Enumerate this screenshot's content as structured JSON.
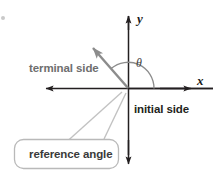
{
  "figure": {
    "width": 219,
    "height": 180,
    "background_color": "#ffffff"
  },
  "axes": {
    "x_label": "x",
    "y_label": "y",
    "axis_color": "#231f20",
    "origin": {
      "x": 128,
      "y": 88
    },
    "x_axis": {
      "left_end": 45,
      "right_end": 213,
      "inner_arrow_x": 190
    },
    "y_axis": {
      "top_end": 16,
      "bottom_end": 163
    }
  },
  "angle": {
    "symbol": "θ",
    "arc_color": "#8c8c8c",
    "arc_radius": 26,
    "start_deg": 0,
    "end_deg": 131
  },
  "terminal_ray": {
    "label": "terminal side",
    "color": "#8c8c8c",
    "from": {
      "x": 128,
      "y": 88
    },
    "to": {
      "x": 87,
      "y": 42
    }
  },
  "initial_ray": {
    "label": "initial side",
    "color": "#231f20"
  },
  "callout": {
    "label": "reference angle",
    "border_color": "#b9b9b9",
    "fill_color": "#ffffff",
    "box": {
      "x": 14,
      "y": 139,
      "width": 105,
      "height": 30,
      "radius": 9
    },
    "tail_color": "#c2c2c2"
  },
  "corner_marker": {
    "name": "bullet-dot",
    "color": "#c9c9c9"
  }
}
